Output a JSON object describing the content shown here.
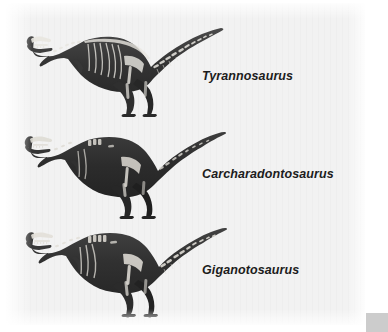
{
  "figure": {
    "type": "comparative-skeletal-plate",
    "medium": "scanned halftone illustration",
    "background_color": "#f2f2f2",
    "page_color": "#ffffff",
    "corner_swatch_color": "#cccccc",
    "specimens": [
      {
        "label": "Tyrannosaurus",
        "body_color": "#3a3a3a",
        "skeleton_color": "#e8e6e0",
        "pose": "walking left, tail raised horizontally",
        "relative_size": 1.0
      },
      {
        "label": "Carcharadontosaurus",
        "body_color": "#2e2e2e",
        "skeleton_color": "#dedbd4",
        "pose": "walking left, tail raised with upward curve",
        "relative_size": 0.97
      },
      {
        "label": "Giganotosaurus",
        "body_color": "#333333",
        "skeleton_color": "#e3e0d9",
        "pose": "walking left, tail raised horizontally",
        "relative_size": 0.99
      }
    ]
  }
}
